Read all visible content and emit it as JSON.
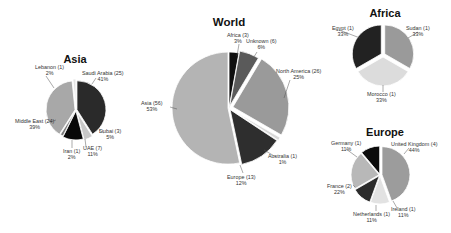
{
  "chart_data": [
    {
      "type": "pie",
      "title": "World",
      "center": [
        229,
        108
      ],
      "radius": 56,
      "slices": [
        {
          "label": "Africa",
          "count": 3,
          "pct": "3%",
          "color": "#101010"
        },
        {
          "label": "Unknown",
          "count": 6,
          "pct": "6%",
          "color": "#5a5a5a"
        },
        {
          "label": "North America",
          "count": 26,
          "pct": "25%",
          "color": "#9a9a9a"
        },
        {
          "label": "Australia",
          "count": 1,
          "pct": "1%",
          "color": "#d8d8d8"
        },
        {
          "label": "Europe",
          "count": 13,
          "pct": "12%",
          "color": "#2e2e2e"
        },
        {
          "label": "Asia",
          "count": 56,
          "pct": "53%",
          "color": "#b4b4b4"
        }
      ],
      "explode": [
        0,
        2,
        4,
        3,
        2,
        1
      ]
    },
    {
      "type": "pie",
      "title": "Asia",
      "center": [
        76,
        110
      ],
      "radius": 29,
      "slices": [
        {
          "label": "Saudi Arabia",
          "count": 25,
          "pct": "41%",
          "color": "#2a2a2a"
        },
        {
          "label": "Dubai",
          "count": 3,
          "pct": "5%",
          "color": "#c8c8c8"
        },
        {
          "label": "UAE",
          "count": 7,
          "pct": "11%",
          "color": "#080808"
        },
        {
          "label": "Iran",
          "count": 1,
          "pct": "2%",
          "color": "#7a7a7a"
        },
        {
          "label": "Middle East",
          "count": 24,
          "pct": "39%",
          "color": "#a8a8a8"
        },
        {
          "label": "Lebanon",
          "count": 1,
          "pct": "2%",
          "color": "#e4e4e4"
        }
      ],
      "explode": [
        1,
        2,
        1,
        0,
        1,
        2
      ]
    },
    {
      "type": "pie",
      "title": "Africa",
      "center": [
        383,
        55
      ],
      "radius": 29,
      "slices": [
        {
          "label": "Sudan",
          "count": 1,
          "pct": "33%",
          "color": "#9a9a9a"
        },
        {
          "label": "Morocco",
          "count": 1,
          "pct": "33%",
          "color": "#dcdcdc"
        },
        {
          "label": "Egypt",
          "count": 1,
          "pct": "33%",
          "color": "#222222"
        }
      ],
      "explode": [
        2,
        2,
        2
      ]
    },
    {
      "type": "pie",
      "title": "Europe",
      "center": [
        380,
        175
      ],
      "radius": 28,
      "slices": [
        {
          "label": "United Kingdom",
          "count": 4,
          "pct": "44%",
          "color": "#9c9c9c"
        },
        {
          "label": "Ireland",
          "count": 1,
          "pct": "11%",
          "color": "#e2e2e2"
        },
        {
          "label": "Netherlands",
          "count": 1,
          "pct": "11%",
          "color": "#2c2c2c"
        },
        {
          "label": "France",
          "count": 2,
          "pct": "22%",
          "color": "#b8b8b8"
        },
        {
          "label": "Germany",
          "count": 1,
          "pct": "11%",
          "color": "#0c0c0c"
        }
      ],
      "explode": [
        2,
        1,
        1,
        1,
        1
      ]
    }
  ],
  "titles": {
    "world": "World",
    "asia": "Asia",
    "africa": "Africa",
    "europe": "Europe"
  },
  "labels": {
    "world": {
      "africa": [
        "Africa (3)",
        "3%"
      ],
      "unknown": [
        "Unknown (6)",
        "6%"
      ],
      "north_america": [
        "North America (26)",
        "25%"
      ],
      "australia": [
        "Australia (1)",
        "1%"
      ],
      "europe": [
        "Europe (13)",
        "12%"
      ],
      "asia": [
        "Asia (56)",
        "53%"
      ]
    },
    "asia": {
      "lebanon": [
        "Lebanon (1)",
        "2%"
      ],
      "saudi": [
        "Saudi Arabia (25)",
        "41%"
      ],
      "middle_east": [
        "Middle East (24)",
        "39%"
      ],
      "dubai": [
        "Dubai (3)",
        "5%"
      ],
      "uae": [
        "UAE (7)",
        "11%"
      ],
      "iran": [
        "Iran (1)",
        "2%"
      ]
    },
    "africa": {
      "egypt": [
        "Egypt (1)",
        "33%"
      ],
      "sudan": [
        "Sudan (1)",
        "33%"
      ],
      "morocco": [
        "Morocco (1)",
        "33%"
      ]
    },
    "europe": {
      "germany": [
        "Germany (1)",
        "11%"
      ],
      "uk": [
        "United Kingdom (4)",
        "44%"
      ],
      "france": [
        "France (2)",
        "22%"
      ],
      "ireland": [
        "Ireland (1)",
        "11%"
      ],
      "netherlands": [
        "Netherlands (1)",
        "11%"
      ]
    }
  }
}
